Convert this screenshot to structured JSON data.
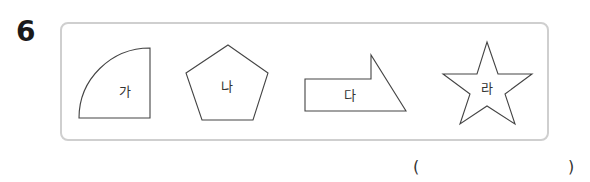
{
  "question": {
    "number": "6"
  },
  "shapes": [
    {
      "label": "가",
      "kind": "quarter-circle"
    },
    {
      "label": "나",
      "kind": "pentagon"
    },
    {
      "label": "다",
      "kind": "arrow-pentagon"
    },
    {
      "label": "라",
      "kind": "star"
    }
  ],
  "answer": {
    "open_paren": "(",
    "close_paren": ")",
    "value": ""
  },
  "colors": {
    "box_border": "#cfcfcf",
    "shape_stroke": "#444444"
  }
}
